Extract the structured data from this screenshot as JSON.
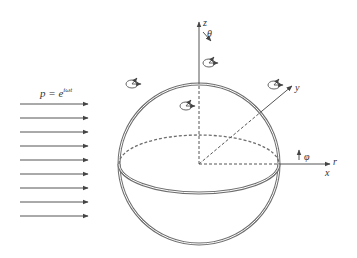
{
  "diagram": {
    "incident_wave_label": "p = e",
    "incident_wave_exponent": "iωt",
    "axes": {
      "z": "z",
      "y": "y",
      "x": "x",
      "r": "r",
      "theta": "θ",
      "phi": "φ"
    },
    "incident_arrow_count": 9,
    "colors": {
      "stroke": "#555555",
      "sphere": "#6e6e6e",
      "text": "#333333"
    }
  }
}
